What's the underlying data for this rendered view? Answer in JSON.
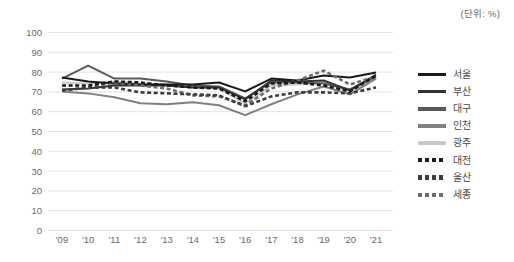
{
  "unit_note": "(단위: %)",
  "legend": {
    "position": "right",
    "items": [
      {
        "label": "서울",
        "color": "#1a1a1a",
        "style": "solid",
        "icon": "legend-line-icon"
      },
      {
        "label": "부산",
        "color": "#333333",
        "style": "solid",
        "icon": "legend-line-icon"
      },
      {
        "label": "대구",
        "color": "#595959",
        "style": "solid",
        "icon": "legend-line-icon"
      },
      {
        "label": "인천",
        "color": "#808080",
        "style": "solid",
        "icon": "legend-line-icon"
      },
      {
        "label": "광주",
        "color": "#c9c9c9",
        "style": "solid",
        "icon": "legend-line-icon"
      },
      {
        "label": "대전",
        "color": "#1a1a1a",
        "style": "dashed",
        "icon": "legend-dashed-line-icon"
      },
      {
        "label": "울산",
        "color": "#3d3d3d",
        "style": "dashed",
        "icon": "legend-dashed-line-icon"
      },
      {
        "label": "세종",
        "color": "#6e6e6e",
        "style": "dashed",
        "icon": "legend-dashed-line-icon"
      }
    ]
  },
  "axes": {
    "y_ticks": [
      "100",
      "90",
      "80",
      "70",
      "60",
      "50",
      "40",
      "30",
      "20",
      "10",
      "0"
    ],
    "x_ticks": [
      "'09",
      "'10",
      "'11",
      "'12",
      "'13",
      "'14",
      "'15",
      "'16",
      "'17",
      "'18",
      "'19",
      "'20",
      "'21"
    ]
  },
  "chart_data": {
    "type": "line",
    "title": "",
    "subtitle": "",
    "xlabel": "",
    "ylabel": "",
    "unit": "(단위: %)",
    "ylim": [
      0,
      100
    ],
    "ytick_step": 10,
    "grid": true,
    "legend_position": "right",
    "categories": [
      "'09",
      "'10",
      "'11",
      "'12",
      "'13",
      "'14",
      "'15",
      "'16",
      "'17",
      "'18",
      "'19",
      "'20",
      "'21"
    ],
    "series": [
      {
        "name": "서울",
        "color": "#1a1a1a",
        "style": "solid",
        "values": [
          77.0,
          75.0,
          74.0,
          73.5,
          73.5,
          73.5,
          74.5,
          70.0,
          76.5,
          75.5,
          78.0,
          77.0,
          79.5
        ]
      },
      {
        "name": "부산",
        "color": "#333333",
        "style": "solid",
        "values": [
          71.0,
          71.5,
          73.0,
          73.0,
          73.0,
          72.0,
          72.0,
          66.0,
          75.5,
          75.0,
          75.5,
          70.5,
          78.5
        ]
      },
      {
        "name": "대구",
        "color": "#595959",
        "style": "solid",
        "values": [
          76.5,
          83.0,
          76.5,
          76.5,
          75.0,
          73.0,
          72.5,
          66.5,
          74.5,
          74.5,
          74.0,
          71.0,
          77.5
        ]
      },
      {
        "name": "인천",
        "color": "#808080",
        "style": "solid",
        "values": [
          70.0,
          69.0,
          67.0,
          64.0,
          63.5,
          64.5,
          63.0,
          58.0,
          63.5,
          68.5,
          72.5,
          68.5,
          76.5
        ]
      },
      {
        "name": "광주",
        "color": "#c9c9c9",
        "style": "solid",
        "values": [
          74.5,
          74.0,
          75.0,
          74.0,
          73.5,
          72.0,
          71.5,
          64.0,
          73.0,
          73.5,
          74.5,
          70.0,
          77.0
        ]
      },
      {
        "name": "대전",
        "color": "#1a1a1a",
        "style": "dashed",
        "values": [
          73.0,
          73.0,
          75.0,
          74.5,
          73.0,
          72.0,
          71.5,
          65.0,
          74.0,
          74.5,
          73.0,
          70.0,
          78.0
        ]
      },
      {
        "name": "울산",
        "color": "#3d3d3d",
        "style": "dashed",
        "values": [
          70.5,
          72.0,
          72.0,
          69.5,
          69.0,
          68.5,
          68.0,
          62.5,
          67.5,
          69.5,
          69.5,
          69.0,
          72.0
        ]
      },
      {
        "name": "세종",
        "color": "#6e6e6e",
        "style": "dashed",
        "values": [
          70.5,
          72.0,
          74.5,
          73.0,
          71.5,
          68.0,
          67.5,
          63.0,
          71.5,
          75.5,
          80.5,
          73.5,
          77.5
        ]
      }
    ]
  }
}
